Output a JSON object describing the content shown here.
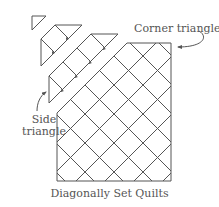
{
  "diagram": {
    "title": "Diagonally Set Quilts",
    "labels": {
      "corner_triangle": "Corner triangle",
      "side_triangle_line1": "Side",
      "side_triangle_line2": "triangle"
    },
    "colors": {
      "line": "#555555",
      "text": "#555555",
      "background": "#ffffff"
    },
    "parts": [
      {
        "name": "corner-triangle-piece",
        "description": "small corner triangle, top-left"
      },
      {
        "name": "row-strip-1",
        "description": "first diagonal row strip with side triangles"
      },
      {
        "name": "row-strip-2",
        "description": "second diagonal row strip with side triangles"
      },
      {
        "name": "assembled-quilt-body",
        "description": "main body of on-point blocks with corner triangle at top right"
      }
    ]
  }
}
